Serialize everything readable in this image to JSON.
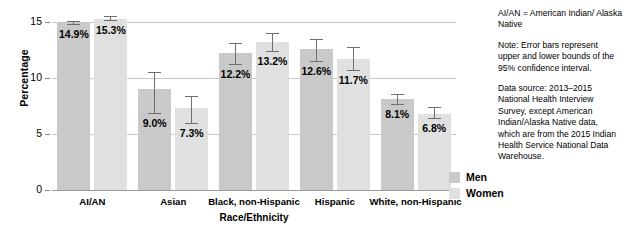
{
  "chart_data": {
    "type": "bar",
    "title": "",
    "xlabel": "Race/Ethnicity",
    "ylabel": "Percentage",
    "ylim": [
      0,
      15
    ],
    "yticks": [
      0,
      5,
      10,
      15
    ],
    "grid": true,
    "legend_position": "right",
    "categories": [
      "AI/AN",
      "Asian",
      "Black, non-Hispanic",
      "Hispanic",
      "White, non-Hispanic"
    ],
    "series": [
      {
        "name": "Men",
        "color": "#c9c9c9",
        "values": [
          14.9,
          9.0,
          12.2,
          12.6,
          8.1
        ],
        "labels": [
          "14.9%",
          "9.0%",
          "12.2%",
          "12.6%",
          "8.1%"
        ],
        "ci_lower": [
          14.7,
          6.8,
          11.2,
          11.4,
          7.6
        ],
        "ci_upper": [
          15.1,
          10.5,
          13.1,
          13.5,
          8.6
        ]
      },
      {
        "name": "Women",
        "color": "#e0e0e0",
        "values": [
          15.3,
          7.3,
          13.2,
          11.7,
          6.8
        ],
        "labels": [
          "15.3%",
          "7.3%",
          "13.2%",
          "11.7%",
          "6.8%"
        ],
        "ci_lower": [
          15.1,
          5.9,
          12.3,
          10.6,
          6.3
        ],
        "ci_upper": [
          15.5,
          8.4,
          14.0,
          12.8,
          7.4
        ]
      }
    ]
  },
  "legend": {
    "items": [
      {
        "label": "Men"
      },
      {
        "label": "Women"
      }
    ]
  },
  "notes": [
    "AI/AN = American Indian/ Alaska Native",
    "Note: Error bars represent upper and lower bounds of the 95% confidence interval.",
    "Data source: 2013–2015 National Health Interview Survey, except American Indian/Alaska Native data, which are from the 2015 Indian Health Service National Data Warehouse."
  ]
}
